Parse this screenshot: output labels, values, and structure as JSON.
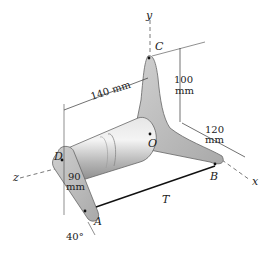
{
  "figure": {
    "axes": {
      "x": "x",
      "y": "y",
      "z": "z"
    },
    "points": {
      "A": "A",
      "B": "B",
      "C": "C",
      "D": "D",
      "O": "O"
    },
    "force": {
      "label": "T"
    },
    "dimensions": {
      "shaft_length": "140 mm",
      "arm_C_value": "100",
      "arm_C_unit": "mm",
      "arm_B_value": "120",
      "arm_B_unit": "mm",
      "arm_A_value": "90",
      "arm_A_unit": "mm",
      "arm_A_angle": "40°"
    },
    "colors": {
      "body_fill": "#c4c4c4",
      "body_dark": "#8f8f8f",
      "line": "#333333"
    }
  }
}
